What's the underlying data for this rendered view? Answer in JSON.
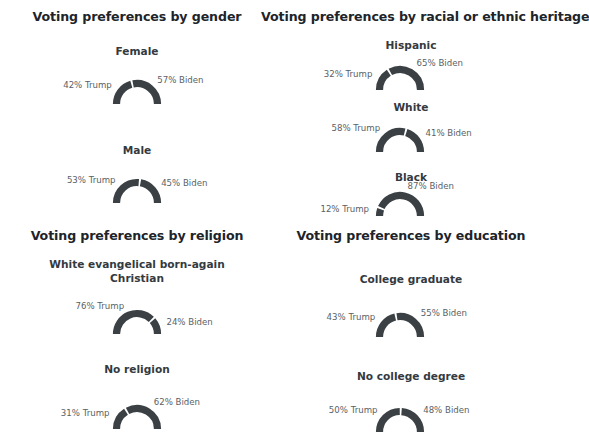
{
  "page": {
    "background": "#ffffff",
    "arc_color": "#3b4044",
    "title_color": "#20242a",
    "caption_color": "#343a40",
    "label_color": "#595f66"
  },
  "chart_data": {
    "type": "pie",
    "subtype": "semicircular gauge / half-donut, one per subgroup",
    "legend": [
      "Trump",
      "Biden"
    ],
    "legend_position": "inline labels flanking each gauge",
    "grid": false,
    "units": "percent",
    "panels": [
      {
        "title": "Voting preferences by gender",
        "groups": [
          {
            "name": "Female",
            "trump_label": "42% Trump",
            "biden_label": "57% Biden",
            "trump": 42,
            "biden": 57
          },
          {
            "name": "Male",
            "trump_label": "53% Trump",
            "biden_label": "45% Biden",
            "trump": 53,
            "biden": 45
          }
        ]
      },
      {
        "title": "Voting preferences by racial or ethnic heritage",
        "groups": [
          {
            "name": "Hispanic",
            "trump_label": "32% Trump",
            "biden_label": "65% Biden",
            "trump": 32,
            "biden": 65
          },
          {
            "name": "White",
            "trump_label": "58% Trump",
            "biden_label": "41% Biden",
            "trump": 58,
            "biden": 41
          },
          {
            "name": "Black",
            "trump_label": "12% Trump",
            "biden_label": "87% Biden",
            "trump": 12,
            "biden": 87
          }
        ]
      },
      {
        "title": "Voting preferences by religion",
        "groups": [
          {
            "name": "White evangelical born-again Christian",
            "trump_label": "76% Trump",
            "biden_label": "24% Biden",
            "trump": 76,
            "biden": 24
          },
          {
            "name": "No religion",
            "trump_label": "31% Trump",
            "biden_label": "62% Biden",
            "trump": 31,
            "biden": 62
          }
        ]
      },
      {
        "title": "Voting preferences by education",
        "groups": [
          {
            "name": "College graduate",
            "trump_label": "43% Trump",
            "biden_label": "55% Biden",
            "trump": 43,
            "biden": 55
          },
          {
            "name": "No college degree",
            "trump_label": "50% Trump",
            "biden_label": "48% Biden",
            "trump": 50,
            "biden": 48
          }
        ]
      }
    ]
  }
}
